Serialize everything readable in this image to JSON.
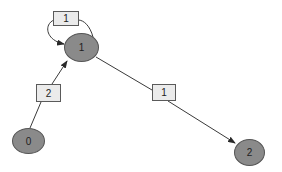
{
  "diagram": {
    "type": "directed-graph",
    "colors": {
      "node_fill": "#8a8a8a",
      "node_border": "#555555",
      "label_fill": "#ebebeb",
      "label_border": "#5a5a5a",
      "edge": "#3a3a3a"
    },
    "nodes": [
      {
        "id": "0",
        "label": "0"
      },
      {
        "id": "1",
        "label": "1"
      },
      {
        "id": "2",
        "label": "2"
      }
    ],
    "edges": [
      {
        "from": "1",
        "to": "1",
        "weight": "1"
      },
      {
        "from": "0",
        "to": "1",
        "weight": "2"
      },
      {
        "from": "1",
        "to": "2",
        "weight": "1"
      }
    ]
  }
}
